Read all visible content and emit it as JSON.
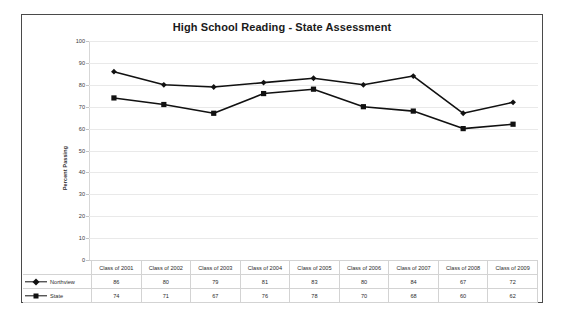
{
  "chart_data": {
    "type": "line",
    "title": "High School Reading - State Assessment",
    "xlabel": "",
    "ylabel": "Percent Passing",
    "ylim": [
      0,
      100
    ],
    "ytick_step": 10,
    "yticks": [
      100,
      90,
      80,
      70,
      60,
      50,
      40,
      30,
      20,
      10,
      0
    ],
    "grid": true,
    "legend_position": "table-left",
    "categories": [
      "Class of 2001",
      "Class of 2002",
      "Class of 2003",
      "Class of 2004",
      "Class of 2005",
      "Class of 2006",
      "Class of 2007",
      "Class of 2008",
      "Class of 2009"
    ],
    "series": [
      {
        "name": "Northview",
        "marker": "diamond",
        "color": "#111111",
        "values": [
          86,
          80,
          79,
          81,
          83,
          80,
          84,
          67,
          72
        ]
      },
      {
        "name": "State",
        "marker": "square",
        "color": "#111111",
        "values": [
          74,
          71,
          67,
          76,
          78,
          70,
          68,
          60,
          62
        ]
      }
    ]
  },
  "colors": {
    "frame": "#4a4a4a",
    "gridline": "#e9e9e9",
    "plot_background": "#ffffff",
    "series": "#111111",
    "table_border": "#d3d3d3"
  }
}
